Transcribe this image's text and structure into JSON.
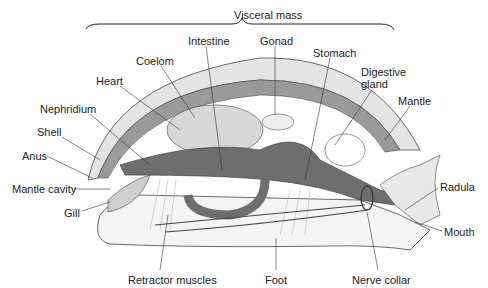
{
  "diagram": {
    "type": "labeled-anatomy",
    "bracket_label": "Visceral mass",
    "labels": [
      {
        "id": "visceral",
        "text": "Visceral mass",
        "x": 234,
        "y": 9
      },
      {
        "id": "intestine",
        "text": "Intestine",
        "x": 188,
        "y": 35
      },
      {
        "id": "gonad",
        "text": "Gonad",
        "x": 260,
        "y": 35
      },
      {
        "id": "coelom",
        "text": "Coelom",
        "x": 136,
        "y": 55
      },
      {
        "id": "stomach",
        "text": "Stomach",
        "x": 313,
        "y": 47
      },
      {
        "id": "heart",
        "text": "Heart",
        "x": 96,
        "y": 75
      },
      {
        "id": "digestive",
        "text": "Digestive",
        "x": 361,
        "y": 66
      },
      {
        "id": "gland",
        "text": "gland",
        "x": 361,
        "y": 78
      },
      {
        "id": "mantle",
        "text": "Mantle",
        "x": 398,
        "y": 95
      },
      {
        "id": "nephridium",
        "text": "Nephridium",
        "x": 40,
        "y": 103
      },
      {
        "id": "shell",
        "text": "Shell",
        "x": 37,
        "y": 126
      },
      {
        "id": "anus",
        "text": "Anus",
        "x": 22,
        "y": 150
      },
      {
        "id": "radula",
        "text": "Radula",
        "x": 440,
        "y": 181
      },
      {
        "id": "mantle_cavity",
        "text": "Mantle cavity",
        "x": 12,
        "y": 183
      },
      {
        "id": "gill",
        "text": "Gill",
        "x": 64,
        "y": 207
      },
      {
        "id": "mouth",
        "text": "Mouth",
        "x": 444,
        "y": 226
      },
      {
        "id": "retractor",
        "text": "Retractor muscles",
        "x": 128,
        "y": 274
      },
      {
        "id": "foot",
        "text": "Foot",
        "x": 265,
        "y": 274
      },
      {
        "id": "nerve_collar",
        "text": "Nerve collar",
        "x": 352,
        "y": 274
      }
    ],
    "colors": {
      "shell": "#e4e4e4",
      "mantle": "#9a9a9a",
      "viscera": "#6e6e6e",
      "organs_light": "#d8d8d8",
      "foot": "#f4f4f4",
      "outline": "#333333",
      "text": "#222222"
    }
  }
}
